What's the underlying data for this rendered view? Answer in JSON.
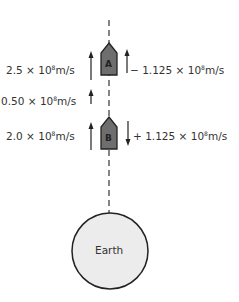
{
  "diagram": {
    "ships": [
      {
        "id": "A",
        "label": "A"
      },
      {
        "id": "B",
        "label": "B"
      }
    ],
    "velocities_left": [
      {
        "value": "2.5",
        "times": "×",
        "base": "10",
        "exp": "8",
        "unit": "m/s",
        "direction": "up"
      },
      {
        "value": "0.50",
        "times": "×",
        "base": "10",
        "exp": "8",
        "unit": "m/s",
        "direction": "up"
      },
      {
        "value": "2.0",
        "times": "×",
        "base": "10",
        "exp": "8",
        "unit": "m/s",
        "direction": "up"
      }
    ],
    "velocities_right": [
      {
        "sign": "−",
        "value": "1.125",
        "times": "×",
        "base": "10",
        "exp": "8",
        "unit": "m/s",
        "direction": "up"
      },
      {
        "sign": "+",
        "value": "1.125",
        "times": "×",
        "base": "10",
        "exp": "8",
        "unit": "m/s",
        "direction": "down"
      }
    ],
    "planet": {
      "label": "Earth"
    },
    "colors": {
      "ship_fill": "#6e6e6e",
      "ship_stroke": "#222222",
      "earth_fill": "#ececec",
      "earth_stroke": "#222222",
      "line": "#444444",
      "text": "#333333"
    }
  }
}
